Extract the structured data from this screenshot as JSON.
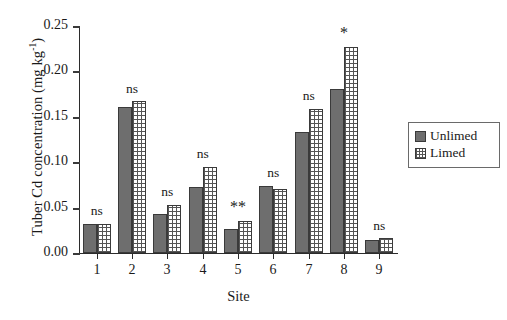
{
  "chart_data": {
    "type": "bar",
    "title": "",
    "xlabel": "Site",
    "ylabel": "Tuber Cd concentration (mg kg",
    "ylabel_sup": "-1",
    "ylabel_close": ")",
    "categories": [
      "1",
      "2",
      "3",
      "4",
      "5",
      "6",
      "7",
      "8",
      "9"
    ],
    "ylim": [
      0.0,
      0.25
    ],
    "ytick_values": [
      0.0,
      0.05,
      0.1,
      0.15,
      0.2,
      0.25
    ],
    "ytick_labels": [
      "0.00",
      "0.05",
      "0.10",
      "0.15",
      "0.20",
      "0.25"
    ],
    "grid": false,
    "legend_position": "right-middle",
    "series": [
      {
        "name": "Unlimed",
        "key": "unlimed",
        "color": "#6e6e6e",
        "pattern": "solid-grey",
        "values": [
          0.032,
          0.161,
          0.043,
          0.073,
          0.026,
          0.074,
          0.133,
          0.181,
          0.014
        ]
      },
      {
        "name": "Limed",
        "key": "limed",
        "color": "#ffffff",
        "pattern": "cross-hatch",
        "values": [
          0.032,
          0.167,
          0.053,
          0.095,
          0.035,
          0.071,
          0.159,
          0.227,
          0.016
        ]
      }
    ],
    "annotations": [
      {
        "site": "1",
        "text": "ns"
      },
      {
        "site": "2",
        "text": "ns"
      },
      {
        "site": "3",
        "text": "ns"
      },
      {
        "site": "4",
        "text": "ns"
      },
      {
        "site": "5",
        "text": "**"
      },
      {
        "site": "6",
        "text": "ns"
      },
      {
        "site": "7",
        "text": "ns"
      },
      {
        "site": "8",
        "text": "*"
      },
      {
        "site": "9",
        "text": "ns"
      }
    ]
  },
  "legend": {
    "items": [
      {
        "label": "Unlimed"
      },
      {
        "label": "Limed"
      }
    ]
  }
}
